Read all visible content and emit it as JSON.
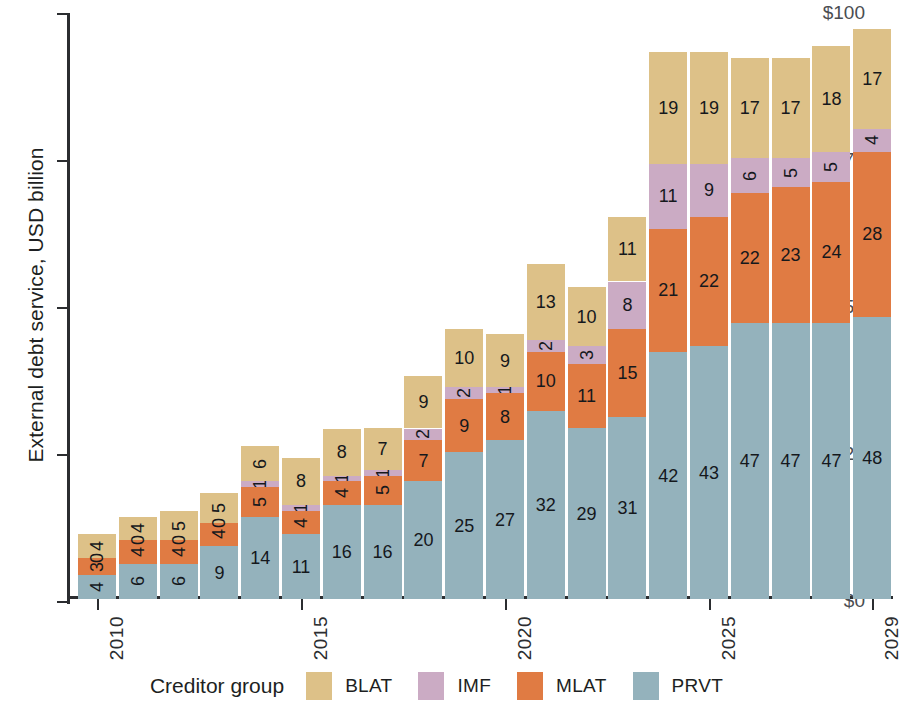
{
  "chart_data": {
    "type": "bar",
    "stacked": true,
    "title": "",
    "xlabel": "",
    "ylabel": "External debt service, USD billion",
    "ylim": [
      0,
      100
    ],
    "ytick_labels": [
      "$0",
      "$25",
      "$50",
      "$75",
      "$100"
    ],
    "ytick_values": [
      0,
      25,
      50,
      75,
      100
    ],
    "grid": false,
    "legend_position": "bottom",
    "legend_title": "Creditor group",
    "x": [
      2010,
      2011,
      2012,
      2013,
      2014,
      2015,
      2016,
      2017,
      2018,
      2019,
      2020,
      2021,
      2022,
      2023,
      2024,
      2025,
      2026,
      2027,
      2028,
      2029
    ],
    "xtick_labels": [
      "2010",
      "2015",
      "2020",
      "2025",
      "2029"
    ],
    "xtick_values": [
      2010,
      2015,
      2020,
      2025,
      2029
    ],
    "categories": [
      "2010",
      "2011",
      "2012",
      "2013",
      "2014",
      "2015",
      "2016",
      "2017",
      "2018",
      "2019",
      "2020",
      "2021",
      "2022",
      "2023",
      "2024",
      "2025",
      "2026",
      "2027",
      "2028",
      "2029"
    ],
    "series": [
      {
        "name": "PRVT",
        "color": "#94b2bc",
        "stack_order": 0,
        "values": [
          4,
          6,
          6,
          9,
          14,
          11,
          16,
          16,
          20,
          25,
          27,
          32,
          29,
          31,
          42,
          43,
          47,
          47,
          47,
          48
        ]
      },
      {
        "name": "MLAT",
        "color": "#e07b43",
        "stack_order": 1,
        "values": [
          3,
          4,
          4,
          4,
          5,
          4,
          4,
          5,
          7,
          9,
          8,
          10,
          11,
          15,
          21,
          22,
          22,
          23,
          24,
          28
        ]
      },
      {
        "name": "IMF",
        "color": "#cbabc4",
        "stack_order": 2,
        "values": [
          0,
          0,
          0,
          0,
          1,
          1,
          1,
          1,
          2,
          2,
          1,
          2,
          3,
          8,
          11,
          9,
          6,
          5,
          5,
          4
        ]
      },
      {
        "name": "BLAT",
        "color": "#ddc188",
        "stack_order": 3,
        "values": [
          4,
          4,
          5,
          5,
          6,
          8,
          8,
          7,
          9,
          10,
          9,
          13,
          10,
          11,
          19,
          19,
          17,
          17,
          18,
          17
        ]
      }
    ],
    "totals": [
      11,
      14,
      15,
      18,
      26,
      24,
      29,
      29,
      38,
      46,
      45,
      57,
      53,
      65,
      93,
      93,
      92,
      92,
      94,
      97
    ]
  },
  "legend": {
    "title": "Creditor group",
    "items": [
      {
        "label": "BLAT",
        "color": "#ddc188"
      },
      {
        "label": "IMF",
        "color": "#cbabc4"
      },
      {
        "label": "MLAT",
        "color": "#e07b43"
      },
      {
        "label": "PRVT",
        "color": "#94b2bc"
      }
    ]
  },
  "axes": {
    "y_title": "External debt service, USD billion"
  }
}
